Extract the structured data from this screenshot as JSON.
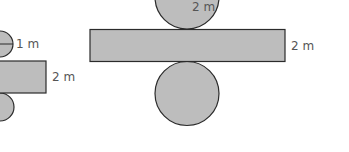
{
  "figures": [
    {
      "name": "small-cylinder-net",
      "radius_label": "1 m",
      "height_label": "2 m"
    },
    {
      "name": "large-cylinder-net",
      "radius_label": "2 m",
      "height_label": "2 m"
    }
  ],
  "colors": {
    "fill": "#bdbdbd",
    "stroke": "#2b2b2b",
    "label": "#555555"
  }
}
